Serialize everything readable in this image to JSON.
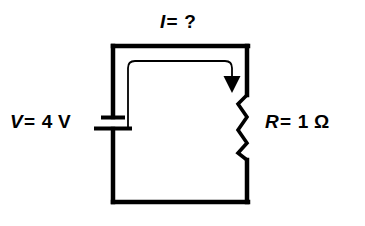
{
  "diagram": {
    "type": "circuit-schematic",
    "background_color": "#ffffff",
    "line_color": "#000000",
    "labels": {
      "current": {
        "symbol": "I",
        "operator": "=",
        "value": "?",
        "full": "I = ?"
      },
      "voltage": {
        "symbol": "V",
        "operator": "=",
        "value": "4 V",
        "full": "V = 4 V"
      },
      "resistance": {
        "symbol": "R",
        "operator": "=",
        "value": "1 Ω",
        "full": "R = 1 Ω"
      }
    },
    "components": {
      "battery": {
        "name": "battery",
        "position": "left-branch",
        "label_ref": "voltage"
      },
      "resistor": {
        "name": "resistor",
        "position": "right-branch",
        "label_ref": "resistance"
      },
      "current_arrow": {
        "name": "current-direction-arrow",
        "direction": "clockwise",
        "label_ref": "current"
      }
    }
  }
}
